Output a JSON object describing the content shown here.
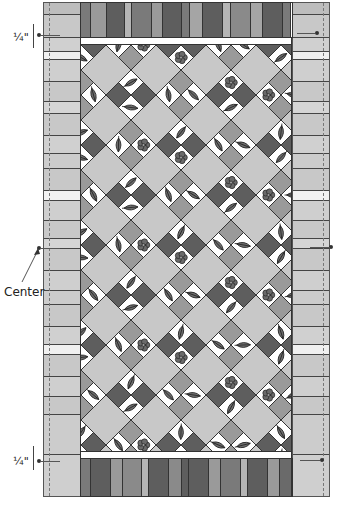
{
  "diagram": {
    "type": "quilt-assembly",
    "labels": {
      "top_measure": "¼\"",
      "bottom_measure": "¼\"",
      "center": "Center"
    },
    "colors": {
      "light_gray": "#c8c8c8",
      "mid_gray": "#9a9a9a",
      "dark_gray": "#5e5e5e",
      "darker_gray": "#4a4a4a",
      "white": "#ffffff",
      "outline": "#333333"
    },
    "top_stripes": [
      {
        "w": 10,
        "c": "#7a7a7a"
      },
      {
        "w": 16,
        "c": "#9a9a9a"
      },
      {
        "w": 18,
        "c": "#5e5e5e"
      },
      {
        "w": 7,
        "c": "#b5b5b5"
      },
      {
        "w": 20,
        "c": "#7a7a7a"
      },
      {
        "w": 11,
        "c": "#9a9a9a"
      },
      {
        "w": 19,
        "c": "#5e5e5e"
      },
      {
        "w": 8,
        "c": "#7a7a7a"
      },
      {
        "w": 13,
        "c": "#a5a5a5"
      },
      {
        "w": 20,
        "c": "#5e5e5e"
      },
      {
        "w": 8,
        "c": "#b5b5b5"
      },
      {
        "w": 20,
        "c": "#8a8a8a"
      },
      {
        "w": 12,
        "c": "#a5a5a5"
      },
      {
        "w": 20,
        "c": "#5e5e5e"
      },
      {
        "w": 8,
        "c": "#7a7a7a"
      }
    ],
    "bottom_stripes": [
      {
        "w": 10,
        "c": "#7a7a7a"
      },
      {
        "w": 20,
        "c": "#5e5e5e"
      },
      {
        "w": 12,
        "c": "#9a9a9a"
      },
      {
        "w": 19,
        "c": "#8a8a8a"
      },
      {
        "w": 7,
        "c": "#b5b5b5"
      },
      {
        "w": 20,
        "c": "#5e5e5e"
      },
      {
        "w": 13,
        "c": "#8a8a8a"
      },
      {
        "w": 8,
        "c": "#5e5e5e"
      },
      {
        "w": 20,
        "c": "#5e5e5e"
      },
      {
        "w": 12,
        "c": "#9a9a9a"
      },
      {
        "w": 20,
        "c": "#7a7a7a"
      },
      {
        "w": 7,
        "c": "#b5b5b5"
      },
      {
        "w": 20,
        "c": "#5e5e5e"
      },
      {
        "w": 12,
        "c": "#9a9a9a"
      },
      {
        "w": 12,
        "c": "#6a6a6a"
      }
    ],
    "side_segments": [
      {
        "h": 12,
        "c": "#bdbdbd"
      },
      {
        "h": 23,
        "c": "#c8c8c8"
      },
      {
        "h": 14,
        "c": "#d0d0d0"
      },
      {
        "h": 8,
        "c": "#f0f0f0"
      },
      {
        "h": 22,
        "c": "#cfcfcf"
      },
      {
        "h": 20,
        "c": "#c8c8c8"
      },
      {
        "h": 12,
        "c": "#d5d5d5"
      },
      {
        "h": 22,
        "c": "#c8c8c8"
      },
      {
        "h": 18,
        "c": "#d0d0d0"
      },
      {
        "h": 15,
        "c": "#cccccc"
      },
      {
        "h": 22,
        "c": "#c8c8c8"
      },
      {
        "h": 10,
        "c": "#f2f2f2"
      },
      {
        "h": 20,
        "c": "#cfcfcf"
      },
      {
        "h": 18,
        "c": "#c8c8c8"
      },
      {
        "h": 10,
        "c": "#d5d5d5"
      },
      {
        "h": 22,
        "c": "#c8c8c8"
      },
      {
        "h": 20,
        "c": "#cfcfcf"
      },
      {
        "h": 14,
        "c": "#cccccc"
      },
      {
        "h": 22,
        "c": "#c8c8c8"
      },
      {
        "h": 18,
        "c": "#d0d0d0"
      },
      {
        "h": 10,
        "c": "#f0f0f0"
      },
      {
        "h": 22,
        "c": "#c8c8c8"
      },
      {
        "h": 20,
        "c": "#cfcfcf"
      },
      {
        "h": 18,
        "c": "#c8c8c8"
      },
      {
        "h": 40,
        "c": "#cccccc"
      }
    ],
    "center_field": {
      "grid_step": 50,
      "motifs": [
        "leaf",
        "leaf",
        "flower",
        "leaf",
        "leaf",
        "flower",
        "leaf",
        "leaf"
      ]
    }
  }
}
